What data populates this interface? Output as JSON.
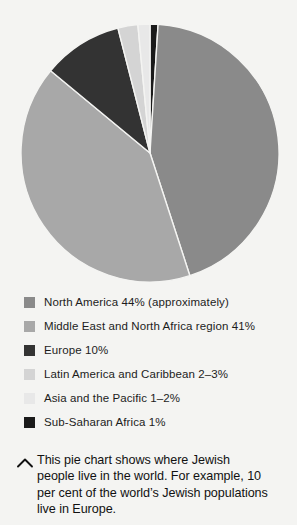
{
  "chart_data": {
    "type": "pie",
    "title": "",
    "categories": [
      "North America",
      "Middle East and North Africa region",
      "Europe",
      "Latin America and Caribbean",
      "Asia and the Pacific",
      "Sub-Saharan Africa"
    ],
    "values": [
      44,
      41,
      10,
      2.5,
      1.5,
      1
    ],
    "value_labels": [
      "44% (approximately)",
      "41%",
      "10%",
      "2-3%",
      "1-2%",
      "1%"
    ],
    "colors": [
      "#8a8a8a",
      "#a8a8a8",
      "#333333",
      "#d4d4d4",
      "#e8e8e8",
      "#1a1a1a"
    ],
    "start_angle_deg": 0,
    "direction": "clockwise",
    "slice_order_clockwise_from_top": [
      "Sub-Saharan Africa",
      "North America",
      "Middle East and North Africa region",
      "Europe",
      "Latin America and Caribbean",
      "Asia and the Pacific"
    ],
    "legend_position": "below",
    "grid": false,
    "xlabel": "",
    "ylabel": ""
  },
  "legend": {
    "items": [
      {
        "label": "North America 44% (approximately)",
        "color": "#8a8a8a"
      },
      {
        "label": "Middle East and North Africa region 41%",
        "color": "#a8a8a8"
      },
      {
        "label": "Europe 10%",
        "color": "#333333"
      },
      {
        "label": "Latin America and Caribbean 2–3%",
        "color": "#d4d4d4"
      },
      {
        "label": "Asia and the Pacific 1–2%",
        "color": "#e8e8e8"
      },
      {
        "label": "Sub-Saharan Africa 1%",
        "color": "#1a1a1a"
      }
    ]
  },
  "caption": {
    "icon": "chevron-up-icon",
    "text": "This pie chart shows where Jewish people live in the world. For example, 10 per cent of the world’s Jewish populations live in Europe."
  }
}
